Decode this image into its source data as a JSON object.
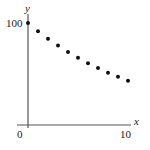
{
  "chart_data": {
    "type": "scatter",
    "title": "",
    "xlabel": "x",
    "ylabel": "y",
    "xlim": [
      0,
      10
    ],
    "ylim": [
      0,
      100
    ],
    "x_ticks": [
      {
        "value": 0,
        "label": "0"
      },
      {
        "value": 10,
        "label": "10"
      }
    ],
    "y_ticks": [
      {
        "value": 100,
        "label": "100"
      }
    ],
    "grid": false,
    "legend": null,
    "series": [
      {
        "name": "points",
        "color": "#111111",
        "x": [
          0,
          1,
          2,
          3,
          4,
          5,
          6,
          7,
          8,
          9,
          10
        ],
        "y": [
          100,
          92,
          84.6,
          77.9,
          71.6,
          65.9,
          60.6,
          55.8,
          51.3,
          47.2,
          43.4
        ]
      }
    ]
  }
}
